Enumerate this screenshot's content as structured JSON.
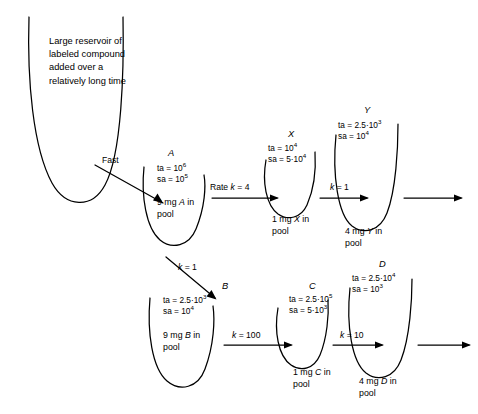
{
  "figure": {
    "type": "compartment-flow-diagram",
    "reservoir": {
      "id": "reservoir",
      "text": "Large reservoir of labeled compound added over a relatively long time"
    },
    "entry_arrow": {
      "label": "Fast"
    },
    "pools": [
      {
        "id": "A",
        "name": "A",
        "ta_label": "ta =",
        "ta_value": "10",
        "ta_exp": "6",
        "sa_label": "sa =",
        "sa_value": "10",
        "sa_exp": "5",
        "amount_line1": "9 mg A in",
        "amount_line2": "pool"
      },
      {
        "id": "X",
        "name": "X",
        "ta_label": "ta =",
        "ta_value": "10",
        "ta_exp": "4",
        "sa_label": "sa =",
        "sa_value": "5·10",
        "sa_exp": "4",
        "amount_line1": "1 mg X in",
        "amount_line2": "pool"
      },
      {
        "id": "Y",
        "name": "Y",
        "ta_label": "ta =",
        "ta_value": "2.5·10",
        "ta_exp": "3",
        "sa_label": "sa =",
        "sa_value": "10",
        "sa_exp": "4",
        "amount_line1": "4 mg Y in",
        "amount_line2": "pool"
      },
      {
        "id": "B",
        "name": "B",
        "ta_label": "ta =",
        "ta_value": "2.5·10",
        "ta_exp": "3",
        "sa_label": "sa =",
        "sa_value": "10",
        "sa_exp": "4",
        "amount_line1": "9 mg B in",
        "amount_line2": "pool"
      },
      {
        "id": "C",
        "name": "C",
        "ta_label": "ta =",
        "ta_value": "2.5·10",
        "ta_exp": "5",
        "sa_label": "sa =",
        "sa_value": "5·10",
        "sa_exp": "3",
        "amount_line1": "1 mg C in",
        "amount_line2": "pool"
      },
      {
        "id": "D",
        "name": "D",
        "ta_label": "ta =",
        "ta_value": "2.5·10",
        "ta_exp": "4",
        "sa_label": "sa =",
        "sa_value": "10",
        "sa_exp": "3",
        "amount_line1": "4 mg D in",
        "amount_line2": "pool"
      }
    ],
    "flows": [
      {
        "id": "A-to-X",
        "label": "Rate k = 4"
      },
      {
        "id": "X-to-Y",
        "label": "k = 1"
      },
      {
        "id": "A-to-B",
        "label": "k = 1"
      },
      {
        "id": "B-to-C",
        "label": "k = 100"
      },
      {
        "id": "C-to-D",
        "label": "k = 10"
      }
    ],
    "colors": {
      "ink": "#000000",
      "background": "#ffffff"
    }
  }
}
